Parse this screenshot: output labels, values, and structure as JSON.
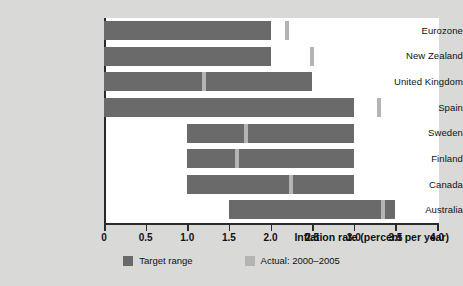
{
  "chart_data": {
    "type": "bar",
    "orientation": "horizontal",
    "title": "",
    "xlabel": "Inflation rate (percent per year)",
    "ylabel": "",
    "xlim": [
      0,
      4.0
    ],
    "xticks": [
      0,
      0.5,
      1.0,
      1.5,
      2.0,
      2.5,
      3.0,
      3.5,
      4.0
    ],
    "xtick_labels": [
      "0",
      "0.5",
      "1.0",
      "1.5",
      "2.0",
      "2.5",
      "3.0",
      "3.5",
      "4.0"
    ],
    "grid": false,
    "legend_position": "bottom",
    "categories": [
      "Eurozone",
      "New Zealand",
      "United Kingdom",
      "Spain",
      "Sweden",
      "Finland",
      "Canada",
      "Australia"
    ],
    "series": [
      {
        "name": "Target range",
        "color": "#6a6a6a",
        "type": "range",
        "values": [
          {
            "category": "Eurozone",
            "low": 0.0,
            "high": 2.0
          },
          {
            "category": "New Zealand",
            "low": 0.0,
            "high": 2.0
          },
          {
            "category": "United Kingdom",
            "low": 0.0,
            "high": 2.5
          },
          {
            "category": "Spain",
            "low": 0.0,
            "high": 3.0
          },
          {
            "category": "Sweden",
            "low": 1.0,
            "high": 3.0
          },
          {
            "category": "Finland",
            "low": 1.0,
            "high": 3.0
          },
          {
            "category": "Canada",
            "low": 1.0,
            "high": 3.0
          },
          {
            "category": "Australia",
            "low": 1.5,
            "high": 3.5
          }
        ]
      },
      {
        "name": "Actual: 2000–2005",
        "color": "#b4b4b4",
        "type": "marker",
        "values": [
          {
            "category": "Eurozone",
            "value": 2.2
          },
          {
            "category": "New Zealand",
            "value": 2.5
          },
          {
            "category": "United Kingdom",
            "value": 1.2
          },
          {
            "category": "Spain",
            "value": 3.3
          },
          {
            "category": "Sweden",
            "value": 1.7
          },
          {
            "category": "Finland",
            "value": 1.6
          },
          {
            "category": "Canada",
            "value": 2.25
          },
          {
            "category": "Australia",
            "value": 3.35
          }
        ]
      }
    ]
  },
  "legend": {
    "entries": [
      {
        "label": "Target range",
        "color": "#6a6a6a"
      },
      {
        "label": "Actual: 2000–2005",
        "color": "#b4b4b4"
      }
    ]
  },
  "axis": {
    "x_title": "Inflation rate (percent per year)"
  },
  "colors": {
    "background": "#d9d9d7",
    "plot_background": "#ffffff",
    "axis": "#2a2a2a",
    "target_range": "#6a6a6a",
    "actual": "#b4b4b4",
    "text": "#111111"
  }
}
